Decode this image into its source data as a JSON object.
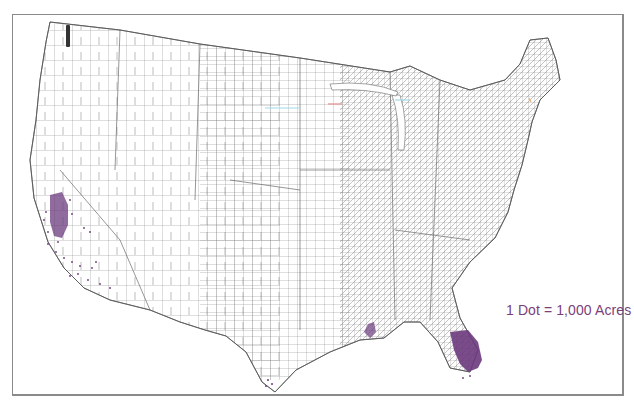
{
  "map": {
    "type": "dot-density",
    "subject": "Acreage by county, conterminous United States",
    "legend": {
      "label": "1 Dot = 1,000 Acres",
      "dot_color": "#6b3a7d"
    },
    "colors": {
      "county_lines": "#6e6e6e",
      "frame": "#8a8a8a",
      "dots": "#6b3a7d",
      "legend_text": "#7a3f7a"
    },
    "concentrations": [
      {
        "region": "South Florida",
        "density": "very high"
      },
      {
        "region": "California Central Valley",
        "density": "high"
      },
      {
        "region": "Southern California",
        "density": "low"
      },
      {
        "region": "Southeast Louisiana",
        "density": "low"
      },
      {
        "region": "South Texas (Rio Grande)",
        "density": "very low"
      },
      {
        "region": "Western Washington",
        "density": "low"
      }
    ]
  }
}
